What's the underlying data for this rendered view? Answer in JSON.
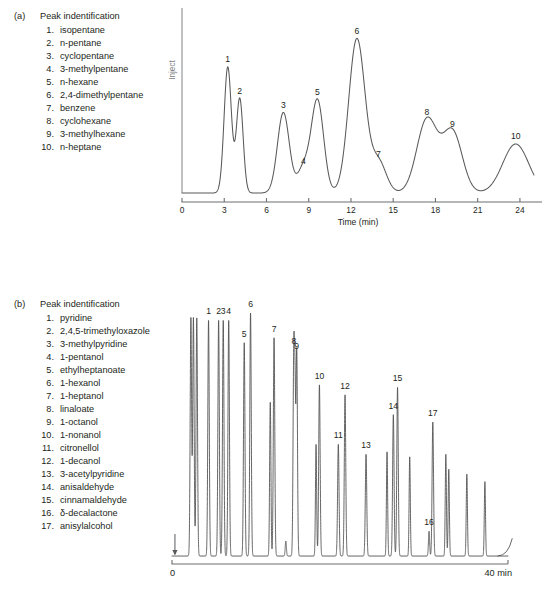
{
  "figure": {
    "background": "#ffffff",
    "trace_color": "#58595b",
    "axis_color": "#6d6e71",
    "text_color": "#231f20"
  },
  "panels": [
    {
      "id": "a",
      "letter": "(a)",
      "legend_title": "Peak indentification",
      "peaks_list": [
        {
          "num": "1.",
          "name": "isopentane"
        },
        {
          "num": "2.",
          "name": "n-pentane"
        },
        {
          "num": "3.",
          "name": "cyclopentane"
        },
        {
          "num": "4.",
          "name": "3-methylpentane"
        },
        {
          "num": "5.",
          "name": "n-hexane"
        },
        {
          "num": "6.",
          "name": "2,4-dimethylpentane"
        },
        {
          "num": "7.",
          "name": "benzene"
        },
        {
          "num": "8.",
          "name": "cyclohexane"
        },
        {
          "num": "9.",
          "name": "3-methylhexane"
        },
        {
          "num": "10.",
          "name": "n-heptane"
        }
      ],
      "inject_label": "Inject",
      "axis_title": "Time (min)"
    },
    {
      "id": "b",
      "letter": "(b)",
      "legend_title": "Peak indentification",
      "peaks_list": [
        {
          "num": "1.",
          "name": "pyridine"
        },
        {
          "num": "2.",
          "name": "2,4,5-trimethyloxazole"
        },
        {
          "num": "3.",
          "name": "3-methylpyridine"
        },
        {
          "num": "4.",
          "name": "1-pentanol"
        },
        {
          "num": "5.",
          "name": "ethylheptanoate"
        },
        {
          "num": "6.",
          "name": "1-hexanol"
        },
        {
          "num": "7.",
          "name": "1-heptanol"
        },
        {
          "num": "8.",
          "name": "linaloate"
        },
        {
          "num": "9.",
          "name": "1-octanol"
        },
        {
          "num": "10.",
          "name": "1-nonanol"
        },
        {
          "num": "11.",
          "name": "citronellol"
        },
        {
          "num": "12.",
          "name": "1-decanol"
        },
        {
          "num": "13.",
          "name": "3-acetylpyridine"
        },
        {
          "num": "14.",
          "name": "anisaldehyde"
        },
        {
          "num": "15.",
          "name": "cinnamaldehyde"
        },
        {
          "num": "16.",
          "name": "δ-decalactone"
        },
        {
          "num": "17.",
          "name": "anisylalcohol"
        }
      ],
      "axis_start_label": "0",
      "axis_end_label": "40 min"
    }
  ],
  "chart_data": [
    {
      "type": "line",
      "id": "chromatogram-a",
      "title": "",
      "xlabel": "Time (min)",
      "ylabel": "",
      "xlim": [
        0,
        25
      ],
      "ylim": [
        0,
        100
      ],
      "grid": false,
      "legend": "none",
      "tick_labels": [
        "0",
        "3",
        "6",
        "9",
        "12",
        "15",
        "18",
        "21",
        "24"
      ],
      "ticks": [
        0,
        3,
        6,
        9,
        12,
        15,
        18,
        21,
        24
      ],
      "inject_marker_time": 0,
      "peaks": [
        {
          "label": "1",
          "compound": "isopentane",
          "rt": 3.25,
          "height": 72,
          "width": 0.26
        },
        {
          "label": "2",
          "compound": "n-pentane",
          "rt": 4.1,
          "height": 54,
          "width": 0.24
        },
        {
          "label": "3",
          "compound": "cyclopentane",
          "rt": 7.2,
          "height": 46,
          "width": 0.42
        },
        {
          "label": "4",
          "compound": "3-methylpentane",
          "rt": 8.62,
          "height": 14,
          "width": 0.42
        },
        {
          "label": "5",
          "compound": "n-hexane",
          "rt": 9.62,
          "height": 53,
          "width": 0.44
        },
        {
          "label": "6",
          "compound": "2,4-dimethylpentane",
          "rt": 12.42,
          "height": 88,
          "width": 0.58
        },
        {
          "label": "7",
          "compound": "benzene",
          "rt": 13.95,
          "height": 18,
          "width": 0.55
        },
        {
          "label": "8",
          "compound": "cyclohexane",
          "rt": 17.4,
          "height": 42,
          "width": 0.72
        },
        {
          "label": "9",
          "compound": "3-methylhexane",
          "rt": 19.2,
          "height": 35,
          "width": 0.7
        },
        {
          "label": "10",
          "compound": "n-heptane",
          "rt": 23.7,
          "height": 28,
          "width": 0.92
        }
      ]
    },
    {
      "type": "line",
      "id": "chromatogram-b",
      "title": "",
      "xlabel": "",
      "ylabel": "",
      "xlim": [
        0,
        40
      ],
      "ylim": [
        0,
        100
      ],
      "grid": false,
      "legend": "none",
      "tick_labels": [
        "0",
        "40 min"
      ],
      "ticks": [
        0,
        40
      ],
      "inject_marker_time": 0.35,
      "peaks": [
        {
          "label": "",
          "compound": "solvent",
          "rt": 2.25,
          "height": 96,
          "width": 0.085
        },
        {
          "label": "",
          "compound": "solvent",
          "rt": 2.55,
          "height": 96,
          "width": 0.085
        },
        {
          "label": "",
          "compound": "solvent",
          "rt": 2.95,
          "height": 96,
          "width": 0.085
        },
        {
          "label": "1",
          "compound": "pyridine",
          "rt": 4.35,
          "height": 95,
          "width": 0.085
        },
        {
          "label": "2",
          "compound": "2,4,5-trimethyloxazole",
          "rt": 5.55,
          "height": 95,
          "width": 0.085
        },
        {
          "label": "3",
          "compound": "3-methylpyridine",
          "rt": 6.1,
          "height": 95,
          "width": 0.085
        },
        {
          "label": "4",
          "compound": "1-pentanol",
          "rt": 6.75,
          "height": 95,
          "width": 0.085
        },
        {
          "label": "5",
          "compound": "ethylheptanoate",
          "rt": 8.6,
          "height": 86,
          "width": 0.085
        },
        {
          "label": "6",
          "compound": "1-hexanol",
          "rt": 9.35,
          "height": 98,
          "width": 0.085
        },
        {
          "label": "7",
          "compound": "1-heptanol",
          "rt": 12.15,
          "height": 88,
          "width": 0.085
        },
        {
          "label": "",
          "compound": "minor",
          "rt": 11.7,
          "height": 62,
          "width": 0.075
        },
        {
          "label": "",
          "compound": "minor",
          "rt": 13.55,
          "height": 6,
          "width": 0.07
        },
        {
          "label": "8",
          "compound": "linaloate",
          "rt": 14.5,
          "height": 83,
          "width": 0.085
        },
        {
          "label": "9",
          "compound": "1-octanol",
          "rt": 14.85,
          "height": 83,
          "width": 0.085
        },
        {
          "label": "",
          "compound": "minor",
          "rt": 14.65,
          "height": 55,
          "width": 0.07
        },
        {
          "label": "10",
          "compound": "1-nonanol",
          "rt": 17.55,
          "height": 69,
          "width": 0.085
        },
        {
          "label": "",
          "compound": "minor",
          "rt": 17.15,
          "height": 45,
          "width": 0.07
        },
        {
          "label": "11",
          "compound": "citronellol",
          "rt": 19.8,
          "height": 45,
          "width": 0.085
        },
        {
          "label": "12",
          "compound": "1-decanol",
          "rt": 20.6,
          "height": 65,
          "width": 0.085
        },
        {
          "label": "13",
          "compound": "3-acetylpyridine",
          "rt": 23.1,
          "height": 41,
          "width": 0.085
        },
        {
          "label": "14",
          "compound": "anisaldehyde",
          "rt": 26.35,
          "height": 57,
          "width": 0.085
        },
        {
          "label": "",
          "compound": "minor",
          "rt": 25.6,
          "height": 42,
          "width": 0.07
        },
        {
          "label": "15",
          "compound": "cinnamaldehyde",
          "rt": 26.85,
          "height": 68,
          "width": 0.085
        },
        {
          "label": "",
          "compound": "minor",
          "rt": 28.3,
          "height": 40,
          "width": 0.07
        },
        {
          "label": "16",
          "compound": "δ-decalactone",
          "rt": 30.6,
          "height": 10,
          "width": 0.07
        },
        {
          "label": "17",
          "compound": "anisylalcohol",
          "rt": 31.05,
          "height": 54,
          "width": 0.085
        },
        {
          "label": "",
          "compound": "minor",
          "rt": 32.6,
          "height": 41,
          "width": 0.07
        },
        {
          "label": "",
          "compound": "minor",
          "rt": 32.95,
          "height": 35,
          "width": 0.07
        },
        {
          "label": "",
          "compound": "minor",
          "rt": 35.1,
          "height": 33,
          "width": 0.07
        },
        {
          "label": "",
          "compound": "minor",
          "rt": 37.25,
          "height": 30,
          "width": 0.07
        }
      ]
    }
  ]
}
